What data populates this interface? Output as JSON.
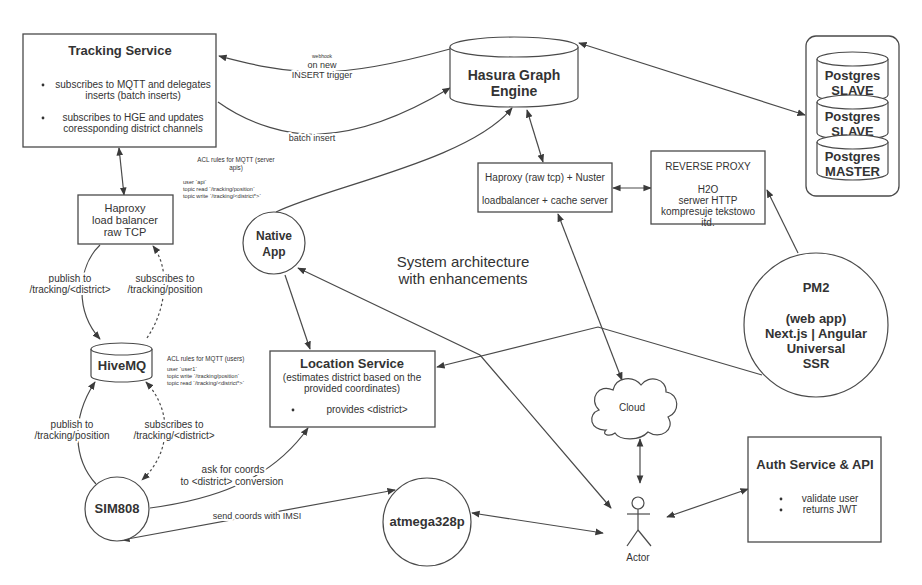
{
  "diagram": {
    "title_lines": [
      "System architecture",
      "with enhancements"
    ],
    "nodes": {
      "tracking_service": {
        "title": "Tracking Service",
        "bullets": [
          [
            "subscribes to MQTT and delegates",
            "inserts (batch inserts)"
          ],
          [
            "subscribes to HGE and updates",
            "coressponding district channels"
          ]
        ]
      },
      "hasura": {
        "lines": [
          "Hasura Graph",
          "Engine"
        ]
      },
      "postgres": [
        {
          "name": "Postgres",
          "role": "SLAVE"
        },
        {
          "name": "Postgres",
          "role": "SLAVE"
        },
        {
          "name": "Postgres",
          "role": "MASTER"
        }
      ],
      "haproxy_tcp": {
        "lines": [
          "Haproxy",
          "load balancer",
          "raw TCP"
        ]
      },
      "haproxy_nuster": {
        "lines": [
          "Haproxy (raw tcp) + Nuster",
          "loadbalancer + cache server"
        ]
      },
      "reverse_proxy": {
        "title": "REVERSE PROXY",
        "lines": [
          "H2O",
          "serwer HTTP",
          "kompresuje tekstowo",
          "itd."
        ]
      },
      "native_app": {
        "lines": [
          "Native",
          "App"
        ]
      },
      "hivemq": {
        "label": "HiveMQ"
      },
      "location_service": {
        "title": "Location Service",
        "subtitle": [
          "(estimates district based on the",
          "provided coordinates)"
        ],
        "bullets": [
          "provides <district>"
        ]
      },
      "pm2": {
        "lines": [
          "PM2",
          "(web app)",
          "Next.js | Angular",
          "Universal",
          "SSR"
        ]
      },
      "cloud": {
        "label": "Cloud"
      },
      "sim808": {
        "label": "SIM808"
      },
      "atmega": {
        "label": "atmega328p"
      },
      "actor": {
        "label": "Actor"
      },
      "auth_service": {
        "title": "Auth Service & API",
        "bullets": [
          "validate user",
          "returns JWT"
        ]
      }
    },
    "annotations": {
      "acl_server": {
        "title": [
          "ACL rules for MQTT (server",
          "apis)"
        ],
        "lines": [
          "user `api`",
          "topic read `/tracking/position`",
          "topic write `/tracking/<district*>`"
        ]
      },
      "acl_users": {
        "title": "ACL rules for MQTT (users)",
        "lines": [
          "user `user1`",
          "topic write `/tracking/position`",
          "topic read `/tracking/<district*>`"
        ]
      }
    },
    "edges": {
      "webhook": [
        "webhook",
        "on new",
        "INSERT trigger"
      ],
      "batch_insert": "batch insert",
      "publish_district": [
        "publish to",
        "/tracking/<district>"
      ],
      "subscribe_position": [
        "subscribes to",
        "/tracking/position"
      ],
      "publish_position": [
        "publish to",
        "/tracking/position"
      ],
      "subscribe_district": [
        "subscribes to",
        "/tracking/<district>"
      ],
      "ask_coords": [
        "ask for coords",
        "to <district> conversion"
      ],
      "send_coords": "send coords with IMSI"
    },
    "colors": {
      "stroke": "#4a4a4a",
      "text": "#333333",
      "background": "#ffffff"
    }
  }
}
